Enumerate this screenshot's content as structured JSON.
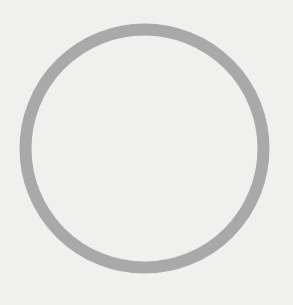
{
  "canvas": {
    "width": 293,
    "height": 305,
    "background_color": "#f0f0ef"
  },
  "ring": {
    "shape": "circle-outline",
    "center_x": 144.5,
    "center_y": 148.5,
    "radius": 119,
    "stroke_width": 12,
    "stroke_color": "#a9a9a9",
    "fill": "none"
  }
}
